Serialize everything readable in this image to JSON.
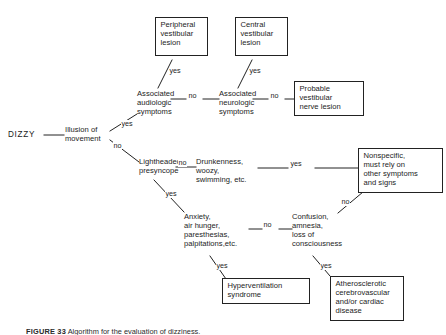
{
  "figure": {
    "type": "clinical decision flowchart",
    "root": "DIZZY",
    "caption_label": "FIGURE 33",
    "caption_text": " Algorithm for the evaluation of dizziness."
  },
  "nodes": {
    "dizzy": {
      "label": "DIZZY",
      "boxed": false
    },
    "illusion": {
      "label": "Illusion of\nmovement",
      "boxed": false
    },
    "assoc_audiologic": {
      "label": "Associated\naudiologic\nsymptoms",
      "boxed": false
    },
    "assoc_neurologic": {
      "label": "Associated\nneurologic\nsymptoms",
      "boxed": false
    },
    "peripheral": {
      "label": "Peripheral\nvestibular\nlesion",
      "boxed": true
    },
    "central": {
      "label": "Central\nvestibular\nlesion",
      "boxed": true
    },
    "probable_nerve": {
      "label": "Probable\nvestibular\nnerve lesion",
      "boxed": true
    },
    "lightheaded": {
      "label": "Lightheaded,\npresyncope",
      "boxed": false
    },
    "drunkenness": {
      "label": "Drunkenness,\nwoozy,\nswimming, etc.",
      "boxed": false
    },
    "nonspecific": {
      "label": "Nonspecific,\nmust rely on\nother symptoms\nand signs",
      "boxed": true
    },
    "anxiety": {
      "label": "Anxiety,\nair hunger,\nparesthesias,\npalpitations,etc.",
      "boxed": false
    },
    "confusion": {
      "label": "Confusion,\namnesia,\nloss of\nconsciousness",
      "boxed": false
    },
    "hyperventilation": {
      "label": "Hyperventilation\nsyndrome",
      "boxed": true
    },
    "atherosclerotic": {
      "label": "Atherosclerotic\ncerebrovascular\nand/or cardiac\ndisease",
      "boxed": true
    }
  },
  "edges": [
    {
      "id": "e1",
      "from": "dizzy",
      "to": "illusion",
      "label": ""
    },
    {
      "id": "e2",
      "from": "illusion",
      "to": "assoc_audiologic",
      "label": "yes"
    },
    {
      "id": "e3",
      "from": "illusion",
      "to": "lightheaded",
      "label": "no"
    },
    {
      "id": "e4",
      "from": "assoc_audiologic",
      "to": "peripheral",
      "label": "yes"
    },
    {
      "id": "e5",
      "from": "assoc_audiologic",
      "to": "assoc_neurologic",
      "label": "no"
    },
    {
      "id": "e6",
      "from": "assoc_neurologic",
      "to": "central",
      "label": "yes"
    },
    {
      "id": "e7",
      "from": "assoc_neurologic",
      "to": "probable_nerve",
      "label": "no"
    },
    {
      "id": "e8",
      "from": "lightheaded",
      "to": "drunkenness",
      "label": "no"
    },
    {
      "id": "e9",
      "from": "lightheaded",
      "to": "anxiety",
      "label": "yes"
    },
    {
      "id": "e10",
      "from": "drunkenness",
      "to": "nonspecific",
      "label": "yes"
    },
    {
      "id": "e11",
      "from": "nonspecific",
      "to": "confusion",
      "label": "no"
    },
    {
      "id": "e12",
      "from": "anxiety",
      "to": "confusion",
      "label": "no"
    },
    {
      "id": "e13",
      "from": "anxiety",
      "to": "hyperventilation",
      "label": "yes"
    },
    {
      "id": "e14",
      "from": "confusion",
      "to": "atherosclerotic",
      "label": "yes"
    }
  ],
  "edge_labels": {
    "illusion_yes": "yes",
    "illusion_no": "no",
    "audiologic_yes": "yes",
    "audiologic_no": "no",
    "neurologic_yes": "yes",
    "neurologic_no": "no",
    "lightheaded_no": "no",
    "lightheaded_yes": "yes",
    "drunkenness_yes": "yes",
    "nonspecific_no": "no",
    "anxiety_no": "no",
    "anxiety_yes": "yes",
    "confusion_yes": "yes"
  },
  "colors": {
    "ink": "#1c1c1c",
    "stroke": "#222222",
    "background": "#ffffff"
  }
}
